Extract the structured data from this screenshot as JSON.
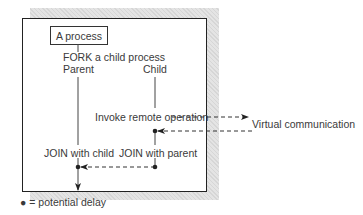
{
  "diagram": {
    "process_box": "A process",
    "fork_label": "FORK a child process",
    "parent_label": "Parent",
    "child_label": "Child",
    "invoke_label": "Invoke remote operation",
    "virtual_label": "Virtual communication",
    "join_child_label": "JOIN with child",
    "join_parent_label": "JOIN with parent",
    "legend": "● = potential delay"
  },
  "colors": {
    "line": "#333333",
    "shadow": "#dddddd"
  }
}
